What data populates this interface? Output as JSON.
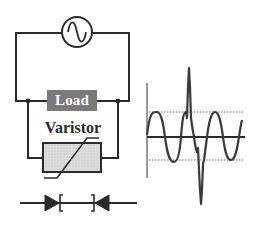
{
  "diagram": {
    "components": {
      "source": {
        "name": "AC source",
        "icon": "ac-sine-source-icon"
      },
      "load": {
        "label": "Load",
        "fill": "#7a7a7a",
        "text_color": "#ffffff"
      },
      "varistor": {
        "label": "Varistor",
        "fill": "#d9d9d9",
        "symbol": "varistor-icon"
      },
      "suppressor": {
        "name": "Bidirectional Zener diode pair",
        "icon": "bidirectional-zener-diode-icon"
      }
    },
    "colors": {
      "wire": "#2b2b2b",
      "waveform": "#3a3a3a",
      "dotted_reference": "#6a6a6a"
    }
  },
  "waveform": {
    "description": "Sinusoidal voltage with transient surge spikes, clamped reference levels shown dotted",
    "axes": {
      "vertical": true,
      "horizontal": true
    },
    "reference_lines": [
      "upper clamp level",
      "lower clamp level"
    ],
    "features": [
      "sine wave ~3.5 cycles",
      "positive transient spike",
      "negative transient spike"
    ]
  }
}
